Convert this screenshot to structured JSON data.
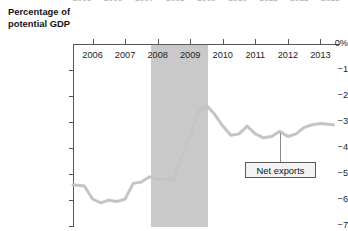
{
  "figure": {
    "name": "net-exports-chart",
    "background": "#ffffff",
    "clipped_top_labels": [
      "2005",
      "2006",
      "2007",
      "2008",
      "2009",
      "2010",
      "2011",
      "2012",
      "2013"
    ]
  },
  "axis": {
    "y_title_line1": "Percentage of",
    "y_title_line2": "potential GDP",
    "y_ticks": [
      "0%",
      "−1",
      "−2",
      "−3",
      "−4",
      "−5",
      "−6",
      "−7"
    ],
    "y_tick_values": [
      0,
      -1,
      -2,
      -3,
      -4,
      -5,
      -6,
      -7
    ],
    "x_ticks": [
      "2006",
      "2007",
      "2008",
      "2009",
      "2010",
      "2011",
      "2012",
      "2013"
    ],
    "x_tick_values": [
      2006,
      2007,
      2008,
      2009,
      2010,
      2011,
      2012,
      2013
    ],
    "axis_color": "#575757"
  },
  "annotations": {
    "series_label": "Net exports",
    "recession_band_label": "",
    "recession_band_color": "#c9c9c9",
    "line_color": "#c4c4c4"
  },
  "chart_data": {
    "type": "line",
    "title": "",
    "subtitle": "",
    "xlabel": "",
    "ylabel": "Percentage of potential GDP",
    "xlim": [
      2005.4,
      2013.6
    ],
    "ylim": [
      -7,
      0
    ],
    "grid": false,
    "legend": "callout label on series",
    "series": [
      {
        "name": "Net exports",
        "color": "#c4c4c4",
        "x": [
          2005.4,
          2005.75,
          2006.0,
          2006.25,
          2006.5,
          2006.75,
          2007.0,
          2007.25,
          2007.5,
          2007.75,
          2008.0,
          2008.25,
          2008.5,
          2008.75,
          2009.0,
          2009.25,
          2009.5,
          2009.75,
          2010.0,
          2010.25,
          2010.5,
          2010.75,
          2011.0,
          2011.25,
          2011.5,
          2011.75,
          2012.0,
          2012.25,
          2012.5,
          2012.75,
          2013.0,
          2013.4
        ],
        "values": [
          -5.4,
          -5.45,
          -5.95,
          -6.1,
          -6.0,
          -6.05,
          -5.95,
          -5.35,
          -5.3,
          -5.1,
          -5.2,
          -5.2,
          -5.2,
          -4.3,
          -3.5,
          -2.6,
          -2.35,
          -2.7,
          -3.15,
          -3.5,
          -3.45,
          -3.15,
          -3.45,
          -3.6,
          -3.55,
          -3.35,
          -3.55,
          -3.45,
          -3.2,
          -3.1,
          -3.05,
          -3.1
        ]
      }
    ],
    "shaded_regions": [
      {
        "label": "recession",
        "x_start": 2007.8,
        "x_end": 2009.55,
        "color": "#c9c9c9"
      }
    ],
    "annotations": [
      {
        "text": "Net exports",
        "x": 2011.15,
        "y": -3.55,
        "box": true
      }
    ]
  }
}
